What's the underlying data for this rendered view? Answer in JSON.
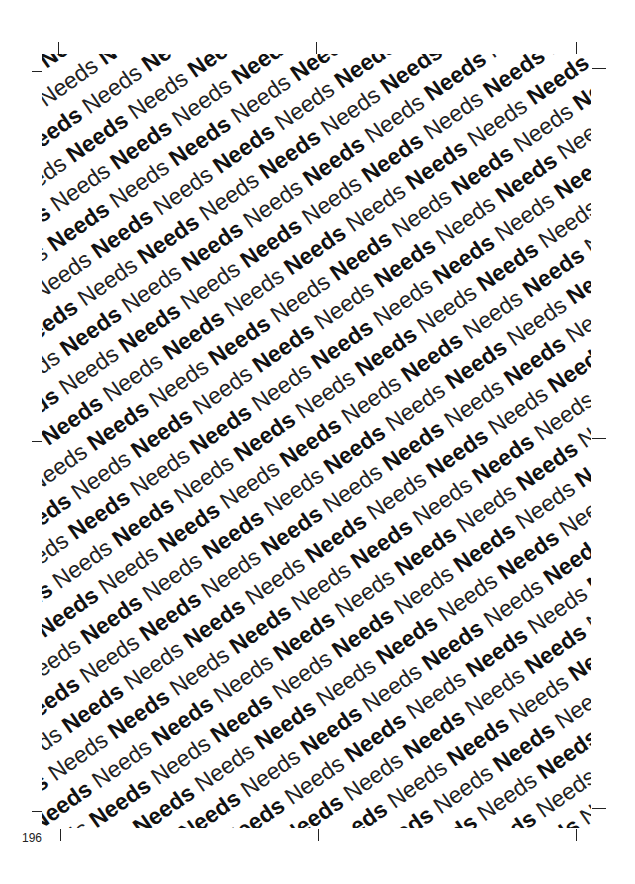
{
  "document": {
    "page_number": "196",
    "pattern": {
      "word": "Needs",
      "styles": [
        "bold",
        "regular"
      ],
      "rotation_deg": -35,
      "text_color": "#1a1a1a",
      "background": "#ffffff"
    },
    "crop_marks": [
      {
        "position": "top-left",
        "orientation": "vertical"
      },
      {
        "position": "top-left",
        "orientation": "horizontal"
      },
      {
        "position": "top-center",
        "orientation": "vertical"
      },
      {
        "position": "top-right",
        "orientation": "vertical"
      },
      {
        "position": "top-right",
        "orientation": "horizontal"
      },
      {
        "position": "middle-left",
        "orientation": "horizontal"
      },
      {
        "position": "middle-right",
        "orientation": "horizontal"
      },
      {
        "position": "bottom-left",
        "orientation": "vertical"
      },
      {
        "position": "bottom-left",
        "orientation": "horizontal"
      },
      {
        "position": "bottom-center",
        "orientation": "vertical"
      },
      {
        "position": "bottom-right",
        "orientation": "vertical"
      },
      {
        "position": "bottom-right",
        "orientation": "horizontal"
      }
    ]
  }
}
